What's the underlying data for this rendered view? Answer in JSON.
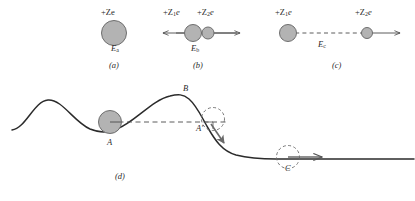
{
  "figure": {
    "type": "physics-diagram",
    "background": "#ffffff",
    "ink_color": "#2b2b2b",
    "circle_fill": "#b3b3b3",
    "circle_stroke": "#6e6e6e",
    "panels": [
      {
        "id": "a",
        "panel_label": "(a)",
        "charge_label": "+Ze",
        "energy_label": "E",
        "energy_subscript": "a",
        "description": "single large positive nucleus at rest"
      },
      {
        "id": "b",
        "panel_label": "(b)",
        "charge_label_left": "+Z",
        "charge_sub_left": "1",
        "charge_tail_left": "e",
        "charge_label_right": "+Z",
        "charge_sub_right": "2",
        "charge_tail_right": "e",
        "energy_label": "E",
        "energy_subscript": "b",
        "description": "two touching fragments with outward double arrow"
      },
      {
        "id": "c",
        "panel_label": "(c)",
        "charge_label_left": "+Z",
        "charge_sub_left": "1",
        "charge_tail_left": "e",
        "charge_label_right": "+Z",
        "charge_sub_right": "2",
        "charge_tail_right": "e",
        "energy_label": "E",
        "energy_subscript": "c",
        "description": "two separated fragments joined by dashed line, arrow to the right"
      },
      {
        "id": "d",
        "panel_label": "(d)",
        "points": [
          {
            "name": "A",
            "label": "A",
            "description": "ball resting in potential well"
          },
          {
            "name": "B",
            "label": "B",
            "description": "crest of the potential barrier"
          },
          {
            "name": "A-prime",
            "label": "A′",
            "description": "ball on the far slope at the same level as A"
          },
          {
            "name": "C",
            "label": "C",
            "description": "ball rolling away on the flat lower plateau"
          }
        ],
        "description": "mechanical analogy: ball in a well, barrier crest, and escape down the slope"
      }
    ]
  }
}
